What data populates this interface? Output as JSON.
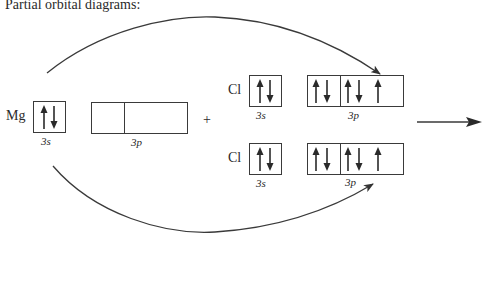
{
  "title": "Partial orbital diagrams:",
  "mg": {
    "symbol": "Mg",
    "orbitals": [
      {
        "label": "3s",
        "cells": [
          [
            "up",
            "down"
          ]
        ]
      },
      {
        "label": "3p",
        "cells": [
          [],
          [],
          []
        ]
      }
    ]
  },
  "plus": "+",
  "cl_top": {
    "symbol": "Cl",
    "orbitals": [
      {
        "label": "3s",
        "cells": [
          [
            "up",
            "down"
          ]
        ]
      },
      {
        "label": "3p",
        "cells": [
          [
            "up",
            "down"
          ],
          [
            "up",
            "down"
          ],
          [
            "up"
          ]
        ]
      }
    ]
  },
  "cl_bottom": {
    "symbol": "Cl",
    "orbitals": [
      {
        "label": "3s",
        "cells": [
          [
            "up",
            "down"
          ]
        ]
      },
      {
        "label": "3p",
        "cells": [
          [
            "up",
            "down"
          ],
          [
            "up",
            "down"
          ],
          [
            "up"
          ]
        ]
      }
    ]
  },
  "arrows": {
    "top_transfer": "Mg 3s electron to top Cl 3p",
    "bottom_transfer": "Mg 3s electron to bottom Cl 3p",
    "reaction": "reaction-arrow"
  }
}
